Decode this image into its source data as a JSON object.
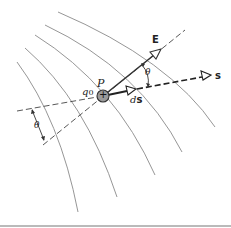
{
  "diagram": {
    "labels": {
      "point": "P",
      "charge_name": "q",
      "charge_subscript": "0",
      "charge_sign": "+",
      "field_vector": "E",
      "path": "s",
      "displacement_d": "d",
      "displacement_s": "s",
      "angle_upper": "θ",
      "angle_lower": "θ"
    },
    "colors": {
      "field_lines": "#8a8a8a",
      "vectors": "#333333",
      "charge_fill": "#9a9a9a",
      "bottom_rule": "#777777"
    },
    "field_line_count": 5
  }
}
